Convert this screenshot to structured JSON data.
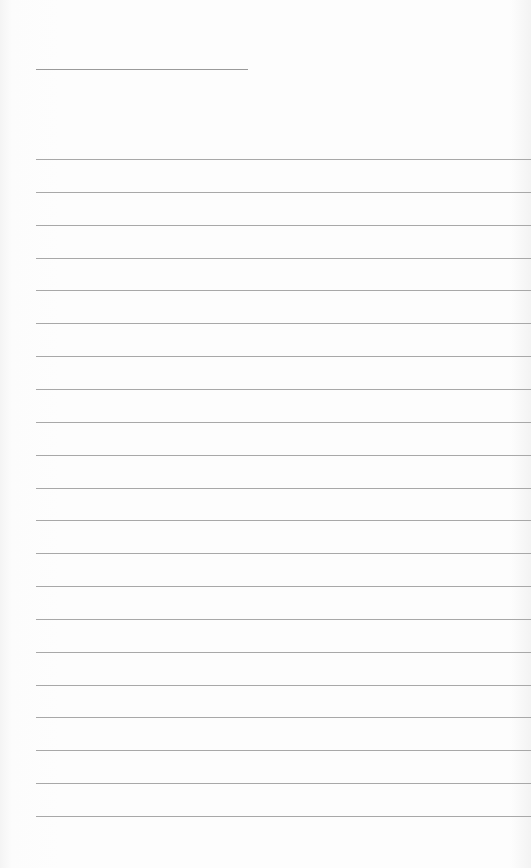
{
  "paper": {
    "type": "lined-paper",
    "header_line": {
      "x": 36,
      "y": 69,
      "width": 212
    },
    "rules": {
      "count": 21,
      "start_y": 159,
      "spacing": 32.85,
      "x": 36
    },
    "colors": {
      "background": "#fdfdfd",
      "line": "#a8a8a8"
    }
  }
}
